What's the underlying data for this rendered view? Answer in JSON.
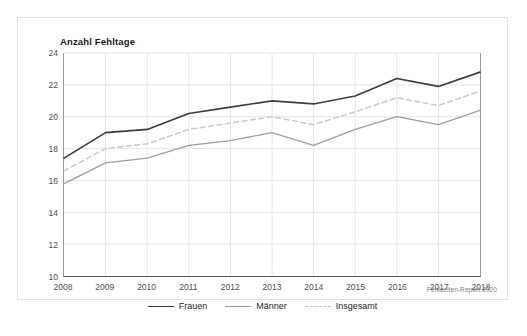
{
  "card": {
    "title": "Anzahl Fehltage",
    "source_note": "Fehlzeiten-Report 2020"
  },
  "legend": {
    "position": "bottom-center",
    "items": [
      {
        "label": "Frauen",
        "color": "#3d3d3d",
        "style": "solid",
        "width": 1.7
      },
      {
        "label": "Männer",
        "color": "#9b9b9b",
        "style": "solid",
        "width": 1.3
      },
      {
        "label": "Insgesamt",
        "color": "#c9c9c9",
        "style": "dashed",
        "width": 1.5
      }
    ]
  },
  "chart_data": {
    "type": "line",
    "title": "Anzahl Fehltage",
    "xlabel": "",
    "ylabel": "Anzahl Fehltage",
    "x": [
      2008,
      2009,
      2010,
      2011,
      2012,
      2013,
      2014,
      2015,
      2016,
      2017,
      2018
    ],
    "categories": [
      "2008",
      "2009",
      "2010",
      "2011",
      "2012",
      "2013",
      "2014",
      "2015",
      "2016",
      "2017",
      "2018"
    ],
    "xlim": [
      2008,
      2018
    ],
    "ylim": [
      10,
      24
    ],
    "yticks": [
      10,
      12,
      14,
      16,
      18,
      20,
      22,
      24
    ],
    "grid": true,
    "series": [
      {
        "name": "Frauen",
        "color": "#3d3d3d",
        "style": "solid",
        "values": [
          17.4,
          19.0,
          19.2,
          20.2,
          20.6,
          21.0,
          20.8,
          21.3,
          22.4,
          21.9,
          22.8
        ]
      },
      {
        "name": "Männer",
        "color": "#9b9b9b",
        "style": "solid",
        "values": [
          15.8,
          17.1,
          17.4,
          18.2,
          18.5,
          19.0,
          18.2,
          19.2,
          20.0,
          19.5,
          20.4
        ]
      },
      {
        "name": "Insgesamt",
        "color": "#c9c9c9",
        "style": "dashed",
        "values": [
          16.6,
          18.0,
          18.3,
          19.2,
          19.6,
          20.0,
          19.5,
          20.3,
          21.2,
          20.7,
          21.6
        ]
      }
    ]
  }
}
